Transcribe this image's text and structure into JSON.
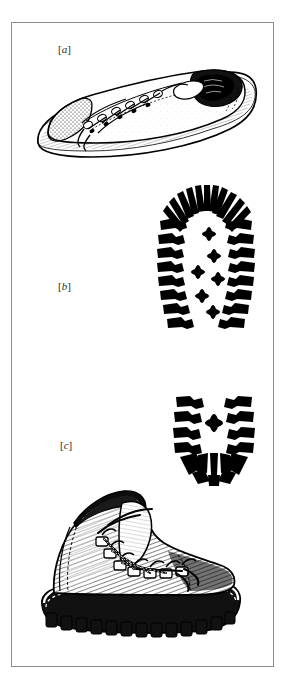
{
  "plate": {
    "name": "footwear-comparison-plate",
    "border_color": "#8d8d8d",
    "background_color": "#ffffff",
    "ink_color": "#000000"
  },
  "labels": {
    "a": {
      "open": "[",
      "letter": "a",
      "close": "]"
    },
    "b": {
      "open": "[",
      "letter": "b",
      "close": "]"
    },
    "c": {
      "open": "[",
      "letter": "c",
      "close": "]"
    }
  },
  "figures": [
    {
      "key": "a",
      "icon": "sneaker-icon",
      "caption_letter": "a",
      "subject": "athletic sneaker, lateral view, laced",
      "style": "pen-and-ink line drawing"
    },
    {
      "key": "b",
      "icon": "boot-sole-forefoot-print-icon",
      "caption_letter": "b",
      "subject": "lugged boot sole impression, forefoot",
      "style": "solid black silhouette"
    },
    {
      "key": "c",
      "icon": "hiking-boot-icon",
      "caption_letter": "c",
      "subject": "heavy hiking boot, lateral view, hook lacing",
      "style": "pen-and-ink engraving with cross-hatching"
    },
    {
      "key": "heel",
      "icon": "boot-sole-heel-print-icon",
      "caption_letter": "",
      "subject": "lugged boot sole impression, heel",
      "style": "solid black silhouette"
    }
  ]
}
